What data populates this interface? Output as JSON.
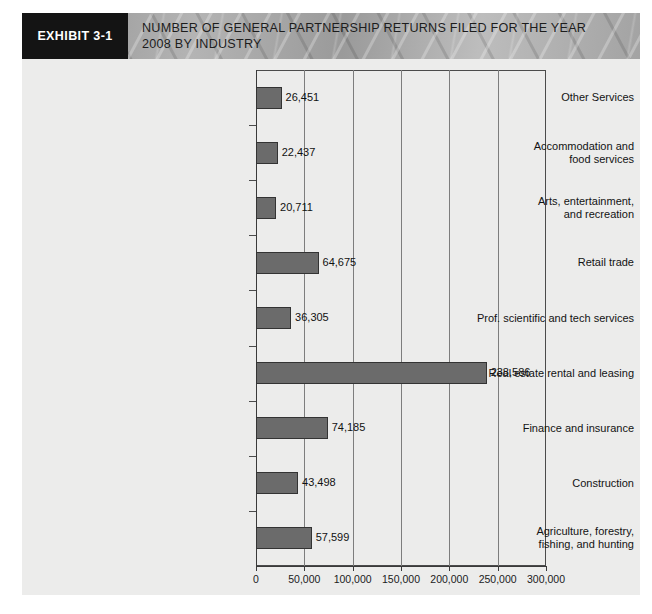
{
  "header": {
    "tag": "EXHIBIT 3-1",
    "title_line1": "NUMBER OF GENERAL PARTNERSHIP RETURNS FILED FOR THE YEAR",
    "title_line2": "2008 BY INDUSTRY",
    "tag_bg": "#141414",
    "banner_bg": "#9c9c9c"
  },
  "chart_data": {
    "type": "bar",
    "orientation": "horizontal",
    "title": "NUMBER OF GENERAL PARTNERSHIP RETURNS FILED FOR THE YEAR 2008 BY INDUSTRY",
    "xlabel": "",
    "ylabel": "",
    "xlim": [
      0,
      300000
    ],
    "grid": true,
    "legend": false,
    "bar_color": "#6b6b6b",
    "bar_edge_color": "#333333",
    "plot_bg": "#ececeb",
    "categories": [
      "Other Services",
      "Accommodation and food services",
      "Arts, entertainment, and recreation",
      "Retail trade",
      "Prof. scientific and tech services",
      "Real estate rental and leasing",
      "Finance and insurance",
      "Construction",
      "Agriculture, forestry, fishing, and hunting"
    ],
    "category_label_lines": [
      [
        "Other Services"
      ],
      [
        "Accommodation and",
        "food services"
      ],
      [
        "Arts, entertainment,",
        "and recreation"
      ],
      [
        "Retail trade"
      ],
      [
        "Prof. scientific and tech services"
      ],
      [
        "Real estate rental and leasing"
      ],
      [
        "Finance and insurance"
      ],
      [
        "Construction"
      ],
      [
        "Agriculture, forestry,",
        "fishing, and hunting"
      ]
    ],
    "values": [
      26451,
      22437,
      20711,
      64675,
      36305,
      238586,
      74185,
      43498,
      57599
    ],
    "value_labels": [
      "26,451",
      "22,437",
      "20,711",
      "64,675",
      "36,305",
      "238,586",
      "74,185",
      "43,498",
      "57,599"
    ],
    "xticks": [
      0,
      50000,
      100000,
      150000,
      200000,
      250000,
      300000
    ],
    "xtick_labels": [
      "0",
      "50,000",
      "100,000",
      "150,000",
      "200,000",
      "250,000",
      "300,000"
    ]
  }
}
